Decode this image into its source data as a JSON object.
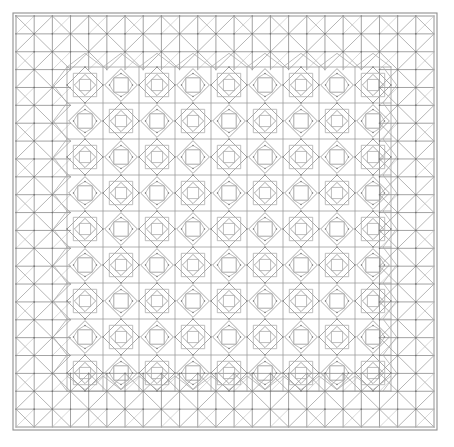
{
  "artwork": {
    "title": "Geometric Tiling Pattern",
    "description": "Symmetric Islamic-style geometric line drawing: a rectangular frame enclosing a triangular-lattice border band and a central field of alternating eight-pointed stars and concentric diamond motifs.",
    "canvas": {
      "width": 454,
      "height": 447,
      "background": "#ffffff"
    },
    "frame": {
      "x": 13,
      "y": 13,
      "width": 424,
      "height": 417,
      "stroke": "#8f8f8f",
      "stroke_width": 1.1
    },
    "border_band": {
      "thickness": 54,
      "sub_cell": 18,
      "stroke": "#a2a2a2",
      "grid_stroke": "#8a8a8a",
      "stroke_width": 0.8,
      "motif": "square-with-diagonals-triangular-lattice"
    },
    "field": {
      "x": 67,
      "y": 67,
      "width": 316,
      "height": 309,
      "cell": 36,
      "columns": 9,
      "rows": 9,
      "motifs": [
        "eight-pointed-star",
        "concentric-diamonds"
      ],
      "arrangement": "checkerboard-alternating",
      "grid_stroke": "#9a9a9a",
      "motif_stroke": "#8c8c8c",
      "inner_stroke": "#a8a8a8",
      "stroke_width": 0.75,
      "node_dot_color": "#6f6f6f",
      "node_dot_radius": 0.75
    },
    "palette": {
      "background": "#ffffff",
      "line_primary": "#8c8c8c",
      "line_secondary": "#a6a6a6",
      "line_faint": "#bdbdbd",
      "node": "#6f6f6f"
    }
  }
}
